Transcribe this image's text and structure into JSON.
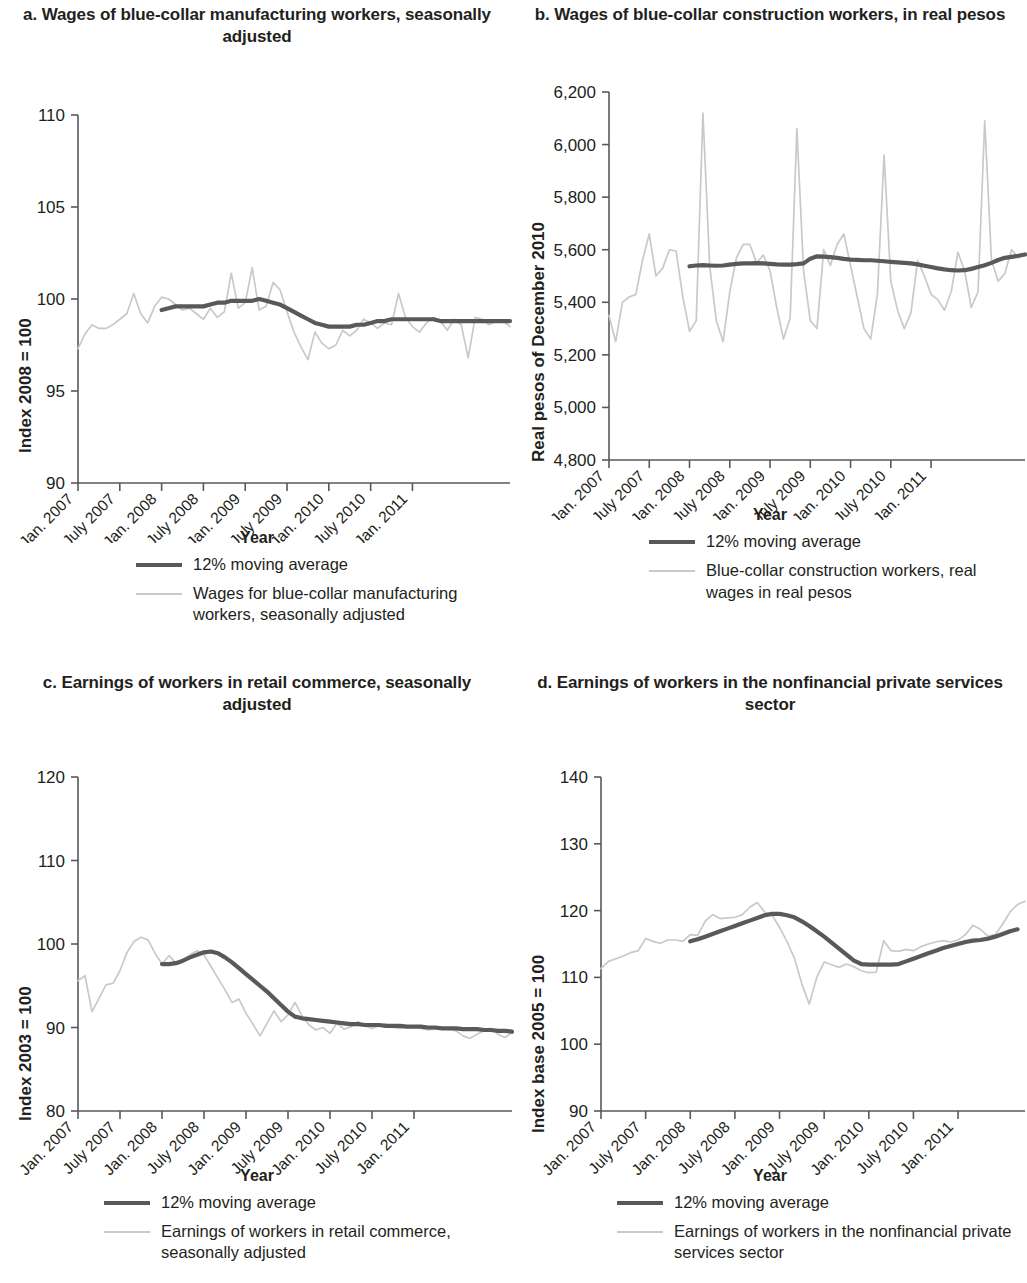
{
  "figure": {
    "panels": [
      {
        "id": "a",
        "title": "a. Wages of blue-collar manufacturing workers, seasonally adjusted",
        "ylabel": "Index 2008 = 100",
        "xlabel": "Year",
        "legend": [
          {
            "key": "ma",
            "label": "12% moving average"
          },
          {
            "key": "raw",
            "label": "Wages for blue-collar manufacturing workers, seasonally adjusted"
          }
        ]
      },
      {
        "id": "b",
        "title": "b. Wages of blue-collar construction workers, in real pesos",
        "ylabel": "Real pesos of December 2010",
        "xlabel": "Year",
        "legend": [
          {
            "key": "ma",
            "label": "12% moving average"
          },
          {
            "key": "raw",
            "label": "Blue-collar construction workers, real wages in real pesos"
          }
        ]
      },
      {
        "id": "c",
        "title": "c. Earnings of workers in retail commerce, seasonally adjusted",
        "ylabel": "Index 2003 = 100",
        "xlabel": "Year",
        "legend": [
          {
            "key": "ma",
            "label": "12% moving average"
          },
          {
            "key": "raw",
            "label": "Earnings of workers in retail commerce, seasonally adjusted"
          }
        ]
      },
      {
        "id": "d",
        "title": "d. Earnings of workers in the nonfinancial private services sector",
        "ylabel": "Index base 2005 = 100",
        "xlabel": "Year",
        "legend": [
          {
            "key": "ma",
            "label": "12% moving average"
          },
          {
            "key": "raw",
            "label": "Earnings of workers in the nonfinancial private services sector"
          }
        ]
      }
    ],
    "colors": {
      "moving_average": "#595959",
      "raw_series": "#c9c9c9",
      "axis": "#58595b",
      "text": "#231f20"
    }
  },
  "chart_data": [
    {
      "type": "line",
      "panel": "a",
      "title": "a. Wages of blue-collar manufacturing workers, seasonally adjusted",
      "xlabel": "Year",
      "ylabel": "Index 2008 = 100",
      "ylim": [
        90,
        110
      ],
      "yticks": [
        90,
        95,
        100,
        105,
        110
      ],
      "ytick_labels": [
        "90",
        "95",
        "100",
        "105",
        "110"
      ],
      "xticks": [
        "Jan. 2007",
        "July 2007",
        "Jan. 2008",
        "July 2008",
        "Jan. 2009",
        "July 2009",
        "Jan. 2010",
        "July 2010",
        "Jan. 2011"
      ],
      "grid": false,
      "legend_position": "below",
      "x_start_month": "Jan. 2007",
      "x_end_month": "Apr. 2011",
      "series": [
        {
          "name": "Wages for blue-collar manufacturing workers, seasonally adjusted",
          "style": "thin-light",
          "values": [
            97.3,
            98.1,
            98.6,
            98.4,
            98.4,
            98.6,
            98.9,
            99.2,
            100.3,
            99.2,
            98.7,
            99.6,
            100.1,
            100.0,
            99.7,
            99.4,
            99.5,
            99.2,
            98.9,
            99.5,
            99.0,
            99.3,
            101.4,
            99.5,
            99.8,
            101.7,
            99.4,
            99.6,
            100.9,
            100.5,
            99.3,
            98.2,
            97.4,
            96.7,
            98.2,
            97.6,
            97.3,
            97.5,
            98.3,
            98.0,
            98.3,
            98.9,
            98.7,
            98.4,
            98.7,
            98.6,
            100.3,
            99.0,
            98.5,
            98.2,
            98.7,
            99.0,
            98.8,
            98.3,
            98.9,
            98.6,
            96.8,
            99.0,
            98.9,
            98.6,
            98.8,
            98.8,
            98.5
          ]
        },
        {
          "name": "12% moving average",
          "style": "thick-dark",
          "start_index": 12,
          "values": [
            99.4,
            99.5,
            99.6,
            99.6,
            99.6,
            99.6,
            99.6,
            99.7,
            99.8,
            99.8,
            99.9,
            99.9,
            99.9,
            99.9,
            100.0,
            99.9,
            99.8,
            99.7,
            99.5,
            99.3,
            99.1,
            98.9,
            98.7,
            98.6,
            98.5,
            98.5,
            98.5,
            98.5,
            98.6,
            98.6,
            98.7,
            98.8,
            98.8,
            98.9,
            98.9,
            98.9,
            98.9,
            98.9,
            98.9,
            98.9,
            98.8,
            98.8,
            98.8,
            98.8,
            98.8,
            98.8,
            98.8,
            98.8,
            98.8,
            98.8,
            98.8
          ]
        }
      ]
    },
    {
      "type": "line",
      "panel": "b",
      "title": "b. Wages of blue-collar construction workers, in real pesos",
      "xlabel": "Year",
      "ylabel": "Real pesos of December 2010",
      "ylim": [
        4800,
        6200
      ],
      "yticks": [
        4800,
        5000,
        5200,
        5400,
        5600,
        5800,
        6000,
        6200
      ],
      "ytick_labels": [
        "4,800",
        "5,000",
        "5,200",
        "5,400",
        "5,600",
        "5,800",
        "6,000",
        "6,200"
      ],
      "xticks": [
        "Jan. 2007",
        "July 2007",
        "Jan. 2008",
        "July 2008",
        "Jan. 2009",
        "July 2009",
        "Jan. 2010",
        "July 2010",
        "Jan. 2011"
      ],
      "grid": false,
      "legend_position": "below",
      "x_start_month": "Jan. 2007",
      "x_end_month": "Apr. 2011",
      "series": [
        {
          "name": "Blue-collar construction workers, real wages in real pesos",
          "style": "thin-light",
          "values": [
            5350,
            5250,
            5400,
            5420,
            5430,
            5560,
            5660,
            5500,
            5530,
            5600,
            5595,
            5420,
            5290,
            5330,
            6120,
            5540,
            5330,
            5250,
            5440,
            5570,
            5620,
            5620,
            5550,
            5580,
            5520,
            5380,
            5260,
            5340,
            6060,
            5520,
            5330,
            5300,
            5600,
            5540,
            5620,
            5660,
            5540,
            5420,
            5300,
            5260,
            5430,
            5960,
            5480,
            5370,
            5300,
            5360,
            5560,
            5500,
            5430,
            5410,
            5370,
            5440,
            5590,
            5520,
            5380,
            5440,
            6090,
            5560,
            5480,
            5510,
            5600,
            5570,
            5580
          ]
        },
        {
          "name": "12% moving average",
          "style": "thick-dark",
          "start_index": 12,
          "values": [
            5537,
            5540,
            5541,
            5540,
            5539,
            5540,
            5543,
            5546,
            5548,
            5548,
            5549,
            5548,
            5546,
            5544,
            5543,
            5543,
            5545,
            5548,
            5566,
            5575,
            5574,
            5572,
            5569,
            5565,
            5562,
            5561,
            5560,
            5560,
            5558,
            5556,
            5554,
            5552,
            5550,
            5548,
            5544,
            5539,
            5534,
            5529,
            5525,
            5522,
            5521,
            5522,
            5527,
            5534,
            5541,
            5550,
            5561,
            5569,
            5573,
            5577,
            5582
          ]
        }
      ]
    },
    {
      "type": "line",
      "panel": "c",
      "title": "c. Earnings of workers in retail commerce, seasonally adjusted",
      "xlabel": "Year",
      "ylabel": "Index 2003 = 100",
      "ylim": [
        80,
        120
      ],
      "yticks": [
        80,
        90,
        100,
        110,
        120
      ],
      "ytick_labels": [
        "80",
        "90",
        "100",
        "110",
        "120"
      ],
      "xticks": [
        "Jan. 2007",
        "July 2007",
        "Jan. 2008",
        "July 2008",
        "Jan. 2009",
        "July 2009",
        "Jan. 2010",
        "July 2010",
        "Jan. 2011"
      ],
      "grid": false,
      "legend_position": "below",
      "x_start_month": "Jan. 2007",
      "x_end_month": "Apr. 2011",
      "series": [
        {
          "name": "Earnings of workers in retail commerce, seasonally adjusted",
          "style": "thin-light",
          "values": [
            95.6,
            96.2,
            91.9,
            93.5,
            95.1,
            95.3,
            96.8,
            99.0,
            100.3,
            100.8,
            100.5,
            98.9,
            97.6,
            98.6,
            97.7,
            98.0,
            98.7,
            99.2,
            98.7,
            97.3,
            95.9,
            94.5,
            93.0,
            93.4,
            91.7,
            90.4,
            89.0,
            90.5,
            92.0,
            90.7,
            91.5,
            93.0,
            91.4,
            90.3,
            89.7,
            90.0,
            89.3,
            90.5,
            89.8,
            90.1,
            90.7,
            90.2,
            89.9,
            90.2,
            90.4,
            90.0,
            89.9,
            90.1,
            90.2,
            89.9,
            89.7,
            89.8,
            90.0,
            89.9,
            89.6,
            89.0,
            88.7,
            89.2,
            89.6,
            89.9,
            89.2,
            88.8,
            89.4
          ]
        },
        {
          "name": "12% moving average",
          "style": "thick-dark",
          "start_index": 12,
          "values": [
            97.6,
            97.6,
            97.7,
            98.0,
            98.4,
            98.7,
            99.0,
            99.1,
            98.9,
            98.4,
            97.8,
            97.1,
            96.4,
            95.7,
            95.0,
            94.3,
            93.5,
            92.7,
            91.9,
            91.3,
            91.1,
            91.0,
            90.9,
            90.8,
            90.7,
            90.6,
            90.5,
            90.4,
            90.4,
            90.3,
            90.3,
            90.3,
            90.2,
            90.2,
            90.2,
            90.1,
            90.1,
            90.1,
            90.0,
            90.0,
            89.9,
            89.9,
            89.9,
            89.8,
            89.8,
            89.8,
            89.7,
            89.7,
            89.6,
            89.6,
            89.5
          ]
        }
      ]
    },
    {
      "type": "line",
      "panel": "d",
      "title": "d. Earnings of workers in the nonfinancial private services sector",
      "xlabel": "Year",
      "ylabel": "Index base 2005 = 100",
      "ylim": [
        90,
        140
      ],
      "yticks": [
        90,
        100,
        110,
        120,
        130,
        140
      ],
      "ytick_labels": [
        "90",
        "100",
        "110",
        "120",
        "130",
        "140"
      ],
      "xticks": [
        "Jan. 2007",
        "July 2007",
        "Jan. 2008",
        "July 2008",
        "Jan. 2009",
        "July 2009",
        "Jan. 2010",
        "July 2010",
        "Jan. 2011"
      ],
      "grid": false,
      "legend_position": "below",
      "x_start_month": "Jan. 2007",
      "x_end_month": "Apr. 2011",
      "series": [
        {
          "name": "Earnings of workers in the nonfinancial private services sector",
          "style": "thin-light",
          "values": [
            111.3,
            112.4,
            112.8,
            113.2,
            113.7,
            114.0,
            115.8,
            115.4,
            115.1,
            115.6,
            115.6,
            115.4,
            116.4,
            116.3,
            118.4,
            119.4,
            118.8,
            118.9,
            119.0,
            119.4,
            120.5,
            121.2,
            119.8,
            119.3,
            117.5,
            115.4,
            112.9,
            109.0,
            106.0,
            110.0,
            112.3,
            111.9,
            111.5,
            112.0,
            111.6,
            111.0,
            110.7,
            110.8,
            115.5,
            114.0,
            113.9,
            114.2,
            114.0,
            114.6,
            115.0,
            115.3,
            115.5,
            115.3,
            115.6,
            116.4,
            117.8,
            117.2,
            116.2,
            116.4,
            118.0,
            119.8,
            120.9,
            121.4
          ]
        },
        {
          "name": "12% moving average",
          "style": "thick-dark",
          "start_index": 12,
          "values": [
            115.4,
            115.7,
            116.1,
            116.5,
            116.9,
            117.3,
            117.7,
            118.1,
            118.5,
            118.9,
            119.3,
            119.5,
            119.5,
            119.3,
            119.0,
            118.4,
            117.7,
            116.9,
            116.1,
            115.2,
            114.3,
            113.4,
            112.5,
            112.0,
            111.9,
            111.9,
            111.9,
            111.9,
            112.0,
            112.4,
            112.8,
            113.2,
            113.6,
            114.0,
            114.4,
            114.7,
            115.0,
            115.3,
            115.5,
            115.6,
            115.8,
            116.1,
            116.5,
            116.9,
            117.2
          ]
        }
      ]
    }
  ]
}
